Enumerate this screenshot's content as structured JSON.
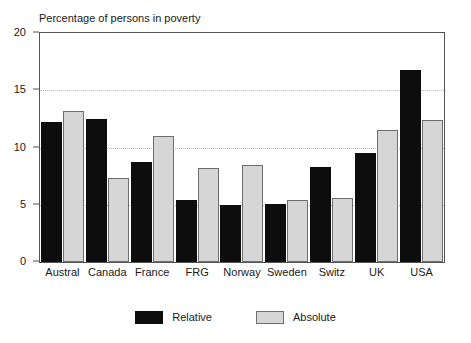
{
  "chart_data": {
    "type": "bar",
    "title": "Percentage of persons in poverty",
    "xlabel": "",
    "ylabel": "",
    "ylim": [
      0,
      20
    ],
    "yticks": [
      0,
      5,
      10,
      15,
      20
    ],
    "grid": true,
    "legend_position": "bottom-center",
    "categories": [
      "Austral",
      "Canada",
      "France",
      "FRG",
      "Norway",
      "Sweden",
      "Switz",
      "UK",
      "USA"
    ],
    "series": [
      {
        "name": "Relative",
        "color": "#0d0d0d",
        "values": [
          12.2,
          12.5,
          8.75,
          5.45,
          5.0,
          5.1,
          8.3,
          9.5,
          16.8
        ]
      },
      {
        "name": "Absolute",
        "color": "#d6d6d6",
        "values": [
          13.2,
          7.35,
          11.0,
          8.2,
          8.5,
          5.4,
          5.55,
          11.5,
          12.4
        ]
      }
    ]
  },
  "legend": {
    "items": [
      {
        "label": "Relative",
        "swatch": "relative"
      },
      {
        "label": "Absolute",
        "swatch": "absolute"
      }
    ]
  }
}
